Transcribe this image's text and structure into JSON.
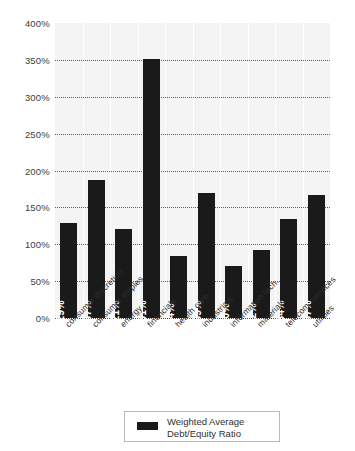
{
  "chart_data": {
    "type": "bar",
    "title": "",
    "xlabel": "",
    "ylabel": "",
    "categories": [
      "consumer discretion",
      "consumer staples",
      "energy",
      "financials",
      "health care",
      "industrials",
      "information tech.",
      "materials",
      "telecom. services",
      "utilities"
    ],
    "values": [
      129,
      187,
      121,
      351,
      84,
      169,
      70,
      92,
      134,
      167
    ],
    "value_labels": [
      "129%",
      "187%",
      "121%",
      "351%",
      "84%",
      "169%",
      "70%",
      "92%",
      "134%",
      "167%"
    ],
    "series": [
      {
        "name": "Weighted Average Debt/Equity Ratio",
        "values": [
          129,
          187,
          121,
          351,
          84,
          169,
          70,
          92,
          134,
          167
        ],
        "color": "#1a1a1a"
      }
    ],
    "ylim": [
      0,
      400
    ],
    "ytick_values": [
      0,
      50,
      100,
      150,
      200,
      250,
      300,
      350,
      400
    ],
    "ytick_labels": [
      "0%",
      "50%",
      "100%",
      "150%",
      "200%",
      "250%",
      "300%",
      "350%",
      "400%"
    ],
    "grid": true,
    "grid_style": "dotted-horizontal",
    "legend_position": "bottom-center",
    "plot_background": "#f4f4f4"
  },
  "legend": {
    "entries": [
      {
        "label_line1": "Weighted Average",
        "label_line2": "Debt/Equity Ratio",
        "color": "#1a1a1a"
      }
    ]
  },
  "colors": {
    "bar": "#1a1a1a",
    "plot_background": "#f4f4f4",
    "grid": "#5f5f5f",
    "text": "#3a3a3a",
    "legend_border": "#b9b9b9"
  }
}
